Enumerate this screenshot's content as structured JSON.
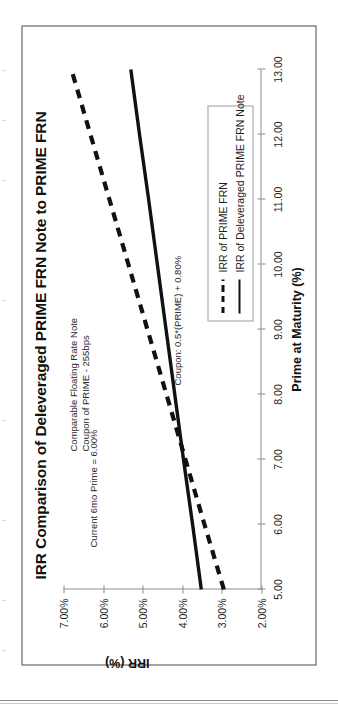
{
  "chart_data": {
    "type": "line",
    "title": "IRR Comparison of Deleveraged PRIME FRN Note to PRIME FRN",
    "xlabel": "Prime at Maturity (%)",
    "ylabel": "IRR (%)",
    "xlim": [
      5.0,
      13.0
    ],
    "ylim": [
      2.0,
      7.0
    ],
    "xticks": [
      "5.00",
      "6.00",
      "7.00",
      "8.00",
      "9.00",
      "10.00",
      "11.00",
      "12.00",
      "13.00"
    ],
    "xtick_values": [
      5.0,
      6.0,
      7.0,
      8.0,
      9.0,
      10.0,
      11.0,
      12.0,
      13.0
    ],
    "yticks": [
      "2.00%",
      "3.00%",
      "4.00%",
      "5.00%",
      "6.00%",
      "7.00%"
    ],
    "ytick_values": [
      2.0,
      3.0,
      4.0,
      5.0,
      6.0,
      7.0
    ],
    "grid": false,
    "legend_position": "lower-right",
    "x": [
      5.0,
      6.0,
      7.0,
      8.0,
      9.0,
      10.0,
      11.0,
      12.0,
      13.0
    ],
    "series": [
      {
        "name": "IRR of PRIME FRN",
        "style": "dashed",
        "color": "#111111",
        "values": [
          2.95,
          3.44,
          3.92,
          4.4,
          4.88,
          5.36,
          5.84,
          6.32,
          6.8
        ]
      },
      {
        "name": "IRR of Deleveraged PRIME FRN Note",
        "style": "solid",
        "color": "#111111",
        "values": [
          3.52,
          3.74,
          3.97,
          4.19,
          4.41,
          4.63,
          4.85,
          5.08,
          5.3
        ]
      }
    ],
    "annotations": [
      {
        "id": "current-prime",
        "text": "Current 6mo Prime = 6.00%"
      },
      {
        "id": "comparable-line1",
        "text": "Comparable Floating Rate Note"
      },
      {
        "id": "comparable-line2",
        "text": "Coupon of PRIME  - 255bps"
      },
      {
        "id": "coupon-formula",
        "text": "Coupon: 0.5*(PRIME) + 0.80%"
      }
    ]
  },
  "legend": {
    "items": [
      {
        "label": "IRR of PRIME FRN",
        "style": "dashed"
      },
      {
        "label": "IRR of Deleveraged PRIME FRN Note",
        "style": "solid"
      }
    ]
  }
}
